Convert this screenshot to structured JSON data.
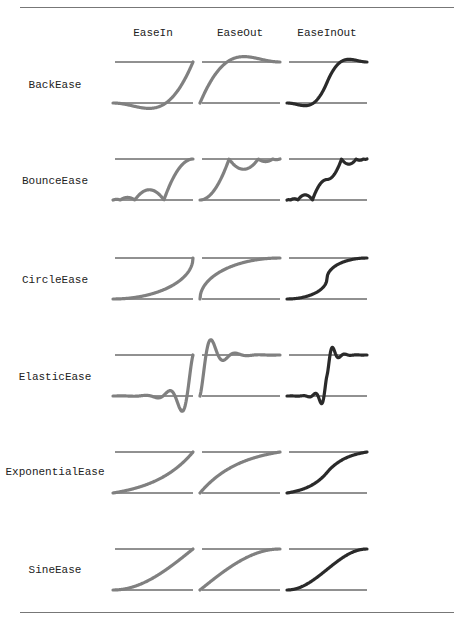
{
  "figure": {
    "columns": [
      "EaseIn",
      "EaseOut",
      "EaseInOut"
    ],
    "rows": [
      "BackEase",
      "BounceEase",
      "CircleEase",
      "ElasticEase",
      "ExponentialEase",
      "SineEase"
    ],
    "colors": {
      "ease_in": "#808080",
      "ease_out": "#808080",
      "ease_in_out": "#2a2a2a",
      "baseline": "#222222",
      "rule": "#777777"
    }
  }
}
